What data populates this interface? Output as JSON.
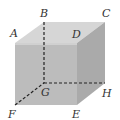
{
  "diagram": {
    "type": "cube",
    "vertices": {
      "A": {
        "label": "A"
      },
      "B": {
        "label": "B"
      },
      "C": {
        "label": "C"
      },
      "D": {
        "label": "D"
      },
      "E": {
        "label": "E"
      },
      "F": {
        "label": "F"
      },
      "G": {
        "label": "G"
      },
      "H": {
        "label": "H"
      }
    },
    "hidden_edges": [
      "BG",
      "FG",
      "GH"
    ],
    "colors": {
      "front_face": "#bdbdbd",
      "top_face": "#d9d9d9",
      "right_face": "#a9a9a9",
      "dashed_edge": "#222222"
    }
  }
}
